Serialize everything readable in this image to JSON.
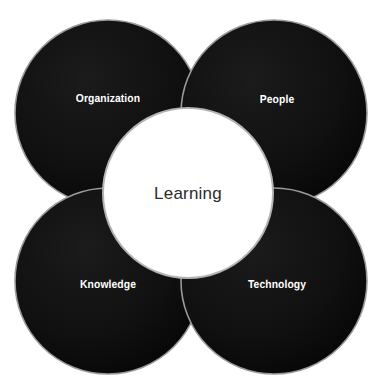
{
  "diagram": {
    "type": "four-circle-overlap-venn",
    "title_visible": false,
    "center": {
      "label": "Learning",
      "shape": "circle",
      "fill_color": "#ffffff",
      "text_color": "#2b2b2b",
      "outline_color": "#b4b4b4",
      "cx": 188,
      "cy": 193,
      "r": 85
    },
    "lobes": [
      {
        "id": "organization",
        "label": "Organization",
        "position": "top-left",
        "fill_color": "#0d0d0d",
        "text_color": "#ffffff",
        "cx": 108,
        "cy": 113,
        "r": 93
      },
      {
        "id": "people",
        "label": "People",
        "position": "top-right",
        "fill_color": "#0d0d0d",
        "text_color": "#ffffff",
        "cx": 274,
        "cy": 113,
        "r": 93
      },
      {
        "id": "knowledge",
        "label": "Knowledge",
        "position": "bottom-left",
        "fill_color": "#0d0d0d",
        "text_color": "#ffffff",
        "cx": 108,
        "cy": 281,
        "r": 93
      },
      {
        "id": "technology",
        "label": "Technology",
        "position": "bottom-right",
        "fill_color": "#0d0d0d",
        "text_color": "#ffffff",
        "cx": 274,
        "cy": 281,
        "r": 93
      }
    ],
    "background_color": "#ffffff"
  }
}
